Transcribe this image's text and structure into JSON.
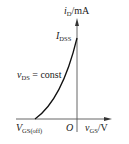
{
  "diagram": {
    "type": "transfer-characteristic",
    "y_axis": {
      "var": "i",
      "sub": "D",
      "unit": "/mA"
    },
    "x_axis": {
      "var": "v",
      "sub": "GS",
      "unit": "/V"
    },
    "origin": "O",
    "peak_label": {
      "var": "I",
      "sub": "DSS"
    },
    "cutoff_label": {
      "var": "V",
      "sub": "GS(off)"
    },
    "condition": {
      "var": "v",
      "sub": "DS",
      "rest": " = const"
    },
    "colors": {
      "ink": "#1a1a1a",
      "background": "#ffffff"
    }
  }
}
